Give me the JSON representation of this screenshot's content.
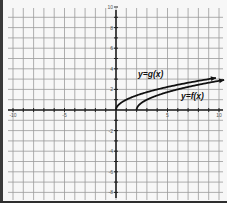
{
  "chart_data": {
    "type": "line",
    "title": "",
    "xlabel": "",
    "ylabel": "",
    "xlim": [
      -10,
      10
    ],
    "ylim": [
      -8,
      10
    ],
    "grid": true,
    "x_tick_labels": [
      "-10",
      "-5",
      "5",
      "10"
    ],
    "y_tick_labels": [
      "10",
      "8",
      "6",
      "4",
      "2",
      "-2",
      "-4",
      "-6",
      "-8"
    ],
    "series": [
      {
        "name": "y=g(x)",
        "label": "y=g(x)",
        "x": [
          0,
          0.25,
          1,
          2,
          4,
          6,
          8,
          9,
          10.5
        ],
        "values": [
          0,
          0.5,
          1,
          1.41,
          2,
          2.45,
          2.83,
          3,
          3.24
        ]
      },
      {
        "name": "y=f(x)",
        "label": "y=f(x)",
        "x": [
          2,
          2.25,
          3,
          4,
          6,
          8,
          10,
          11
        ],
        "values": [
          0,
          0.5,
          1,
          1.41,
          2,
          2.45,
          2.83,
          3
        ]
      }
    ],
    "legend": "inline labels near curves"
  },
  "labels": {
    "g": "y=g(x)",
    "f": "y=f(x)"
  },
  "colors": {
    "grid": "#9a9a9a",
    "axis": "#222222",
    "curve": "#111111",
    "background": "#f7f7f7"
  }
}
